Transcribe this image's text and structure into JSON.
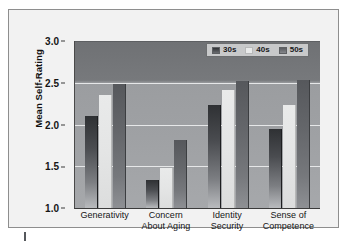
{
  "figure": {
    "background_color": "#f2f2f2",
    "plot_background_top": "#6f7174",
    "plot_background_bottom": "#a6a8ab"
  },
  "chart_data": {
    "type": "bar",
    "title": "",
    "xlabel": "",
    "ylabel": "Mean Self-Rating",
    "ylim": [
      1.0,
      3.0
    ],
    "yticks": [
      "1.0",
      "1.5",
      "2.0",
      "2.5",
      "3.0"
    ],
    "grid": true,
    "legend_position": "top-right",
    "categories": [
      "Generativity",
      "Concern About Aging",
      "Identity Security",
      "Sense of Competence"
    ],
    "category_lines": [
      [
        "Generativity",
        ""
      ],
      [
        "Concern",
        "About Aging"
      ],
      [
        "Identity",
        "Security"
      ],
      [
        "Sense of",
        "Competence"
      ]
    ],
    "series": [
      {
        "name": "30s",
        "color": "#3a3c40",
        "values": [
          2.1,
          1.33,
          2.23,
          1.95
        ]
      },
      {
        "name": "40s",
        "color": "#e7e8e8",
        "values": [
          2.35,
          1.48,
          2.41,
          2.23
        ]
      },
      {
        "name": "50s",
        "color": "#6a6c70",
        "values": [
          2.48,
          1.81,
          2.52,
          2.53
        ]
      }
    ]
  },
  "legend": {
    "items": [
      {
        "label": "30s",
        "swatch": "legend-swatch-30s"
      },
      {
        "label": "40s",
        "swatch": "legend-swatch-40s"
      },
      {
        "label": "50s",
        "swatch": "legend-swatch-50s"
      }
    ]
  }
}
